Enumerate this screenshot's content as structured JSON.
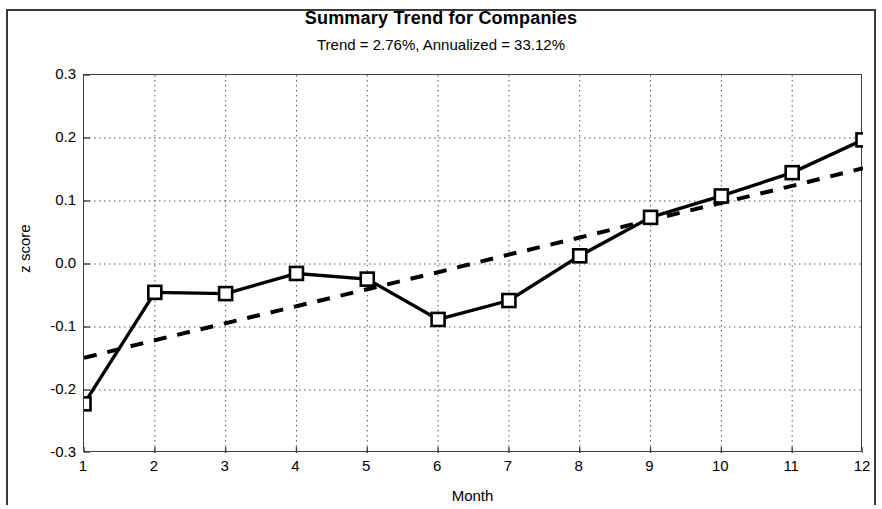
{
  "chart_data": {
    "type": "line",
    "title": "Summary Trend for Companies",
    "subtitle": "Trend = 2.76%, Annualized = 33.12%",
    "xlabel": "Month",
    "ylabel": "z score",
    "xlim": [
      1,
      12
    ],
    "ylim": [
      -0.3,
      0.3
    ],
    "grid": true,
    "legend": "none",
    "x": [
      1,
      2,
      3,
      4,
      5,
      6,
      7,
      8,
      9,
      10,
      11,
      12
    ],
    "xtick_labels": [
      "1",
      "2",
      "3",
      "4",
      "5",
      "6",
      "7",
      "8",
      "9",
      "10",
      "11",
      "12"
    ],
    "ytick_values": [
      0.3,
      0.2,
      0.1,
      0.0,
      -0.1,
      -0.2,
      -0.3
    ],
    "ytick_labels": [
      "0.3",
      "0.2",
      "0.1",
      "0.0",
      "-0.1",
      "-0.2",
      "-0.3"
    ],
    "series": [
      {
        "name": "z score",
        "style": "solid-with-square-markers",
        "color": "#000000",
        "values": [
          -0.222,
          -0.045,
          -0.047,
          -0.015,
          -0.024,
          -0.088,
          -0.058,
          0.013,
          0.074,
          0.108,
          0.145,
          0.197
        ]
      },
      {
        "name": "trend",
        "style": "dashed",
        "color": "#000000",
        "values": [
          -0.149,
          -0.121,
          -0.094,
          -0.067,
          -0.04,
          -0.013,
          0.015,
          0.042,
          0.07,
          0.097,
          0.124,
          0.152
        ]
      }
    ]
  }
}
